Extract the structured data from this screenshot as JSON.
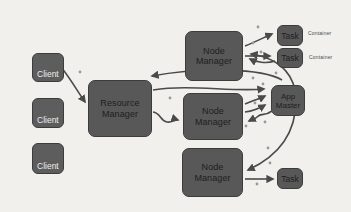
{
  "diagram_type": "architecture-diagram",
  "colors": {
    "background": "#f1f0ed",
    "box_fill": "#585858",
    "box_border": "#3c3c3c",
    "box_text": "#1e1e1e",
    "client_text": "#ececec",
    "arrow": "#4a4a4a",
    "dot": "#999999"
  },
  "nodes": {
    "clients": [
      "Client",
      "Client",
      "Client"
    ],
    "resource_manager": "Resource Manager",
    "node_managers": [
      "Node Manager",
      "Node Manager",
      "Node Manager"
    ],
    "app_master": "App Master",
    "tasks": [
      "Task",
      "Task",
      "Task"
    ],
    "container_labels": [
      "Container",
      "Container"
    ]
  },
  "edges": [
    {
      "from": "client-1",
      "to": "resource-manager"
    },
    {
      "from": "app-master",
      "to": "resource-manager"
    },
    {
      "from": "resource-manager",
      "to": "app-master"
    },
    {
      "from": "resource-manager",
      "to": "node-manager-2"
    },
    {
      "from": "node-manager-1",
      "to": "task-1"
    },
    {
      "from": "node-manager-1",
      "to": "task-2"
    },
    {
      "from": "task-2",
      "to": "node-manager-1"
    },
    {
      "from": "node-manager-2",
      "to": "app-master"
    },
    {
      "from": "app-master",
      "to": "node-manager-2"
    },
    {
      "from": "app-master",
      "to": "node-manager-1"
    },
    {
      "from": "app-master",
      "to": "node-manager-3"
    },
    {
      "from": "node-manager-3",
      "to": "task-3"
    }
  ]
}
